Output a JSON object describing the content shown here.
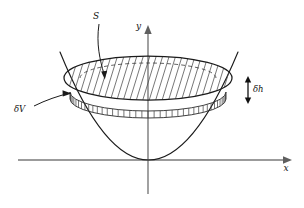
{
  "figure": {
    "title_visible": false,
    "background_color": "#ffffff",
    "ink_color": "#111111",
    "axis_color": "#7a7a7a"
  },
  "axes": {
    "x_label": "x",
    "y_label": "y",
    "origin": {
      "x": 148,
      "y": 160
    },
    "x_axis": {
      "start_x": 18,
      "end_x": 288,
      "y": 160
    },
    "y_axis": {
      "x": 148,
      "start_y": 194,
      "end_y": 30
    }
  },
  "annotations": [
    {
      "id": "surface-label",
      "label": "S",
      "label_x": 96,
      "label_y": 17,
      "leader_from": {
        "x": 99,
        "y": 22
      },
      "leader_to": {
        "x": 104,
        "y": 78
      },
      "meaning": "cross-sectional surface of the disc"
    },
    {
      "id": "volume-label",
      "label": "δV",
      "label_x": 16,
      "label_y": 110,
      "leader_from": {
        "x": 33,
        "y": 106
      },
      "leader_to": {
        "x": 68,
        "y": 93
      },
      "meaning": "element of volume, the thin shell slab"
    },
    {
      "id": "height-label",
      "label": "δh",
      "label_x": 253,
      "label_y": 92,
      "arrow_x": 248,
      "arrow_top_y": 80,
      "arrow_bottom_y": 100,
      "meaning": "infinitesimal thickness of the slab"
    }
  ],
  "shapes": {
    "parabola": {
      "type": "parabola",
      "vertex": {
        "x": 148,
        "y": 160
      },
      "left_tip": {
        "x": 60,
        "y": 55
      },
      "right_tip": {
        "x": 238,
        "y": 55
      },
      "stroke": "#1b1b1b"
    },
    "top_ellipse": {
      "center_x": 148,
      "center_y": 78,
      "rx": 84,
      "ry": 22,
      "stroke": "#1b1b1b",
      "hatched": true,
      "hatch_count": 26
    },
    "slab": {
      "top_center_y": 92,
      "bottom_center_y": 99,
      "rx": 78,
      "ry": 19,
      "tick_count": 40,
      "stroke": "#2a2a2a"
    },
    "dashed_arc": {
      "center_x": 148,
      "center_y": 78,
      "rx": 68,
      "ry": 15,
      "style": "dashed"
    }
  }
}
